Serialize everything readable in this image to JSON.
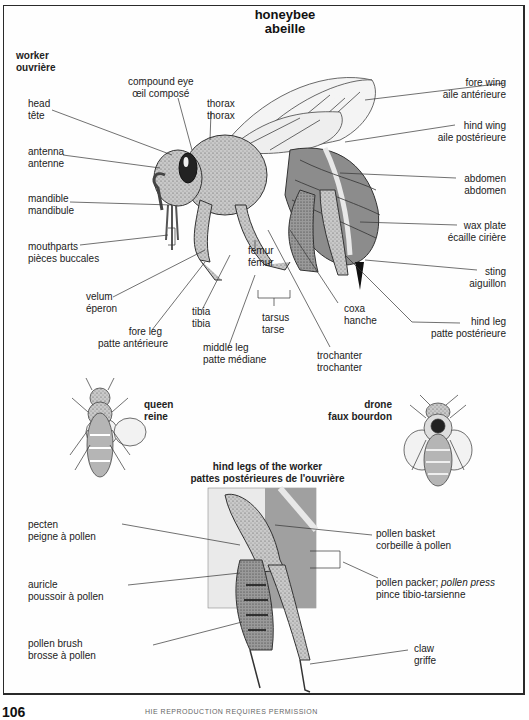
{
  "title": {
    "en": "honeybee",
    "fr": "abeille"
  },
  "sections": {
    "worker": {
      "en": "worker",
      "fr": "ouvrière"
    },
    "queen": {
      "en": "queen",
      "fr": "reine"
    },
    "drone": {
      "en": "drone",
      "fr": "faux bourdon"
    },
    "hind_legs": {
      "en": "hind legs of the worker",
      "fr": "pattes postérieures de l'ouvrière"
    }
  },
  "worker_labels": [
    {
      "en": "compound eye",
      "fr": "œil composé"
    },
    {
      "en": "head",
      "fr": "tête"
    },
    {
      "en": "thorax",
      "fr": "thorax"
    },
    {
      "en": "antenna",
      "fr": "antenne"
    },
    {
      "en": "mandible",
      "fr": "mandibule"
    },
    {
      "en": "mouthparts",
      "fr": "pièces buccales"
    },
    {
      "en": "velum",
      "fr": "éperon"
    },
    {
      "en": "fore leg",
      "fr": "patte antérieure"
    },
    {
      "en": "tibia",
      "fr": "tibia"
    },
    {
      "en": "middle leg",
      "fr": "patte médiane"
    },
    {
      "en": "femur",
      "fr": "fémur"
    },
    {
      "en": "tarsus",
      "fr": "tarse"
    },
    {
      "en": "trochanter",
      "fr": "trochanter"
    },
    {
      "en": "coxa",
      "fr": "hanche"
    },
    {
      "en": "fore wing",
      "fr": "aile antérieure"
    },
    {
      "en": "hind wing",
      "fr": "aile postérieure"
    },
    {
      "en": "abdomen",
      "fr": "abdomen"
    },
    {
      "en": "wax plate",
      "fr": "écaille cirière"
    },
    {
      "en": "sting",
      "fr": "aiguillon"
    },
    {
      "en": "hind leg",
      "fr": "patte postérieure"
    }
  ],
  "hind_leg_labels": [
    {
      "en": "pecten",
      "fr": "peigne à pollen"
    },
    {
      "en": "auricle",
      "fr": "poussoir à pollen"
    },
    {
      "en": "pollen brush",
      "fr": "brosse à pollen"
    },
    {
      "en": "pollen basket",
      "fr": "corbeille à pollen"
    },
    {
      "en": "pollen packer;",
      "en_italic": "pollen press",
      "fr": "pince tibio-tarsienne"
    },
    {
      "en": "claw",
      "fr": "griffe"
    }
  ],
  "footer": {
    "page": "106",
    "text": "HIE REPRODUCTION REQUIRES PERMISSION"
  },
  "colors": {
    "ink": "#222222",
    "body_stipple": "#b8b8b8",
    "abdomen": "#8c8c8c",
    "stripe": "#e8e8e8",
    "frame": "#2a2a2a"
  }
}
